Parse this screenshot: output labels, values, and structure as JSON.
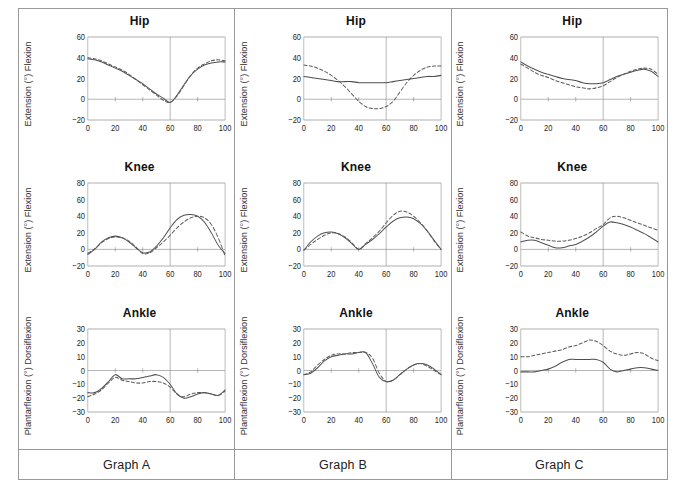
{
  "figure": {
    "columns": [
      {
        "id": "A",
        "footer_label": "Graph A",
        "charts": [
          {
            "title": "Hip",
            "ylabel": "Extension  (°)   Flexion",
            "yticks": [
              "60",
              "40",
              "20",
              "0",
              "−20"
            ],
            "xticks": [
              "0",
              "20",
              "40",
              "60",
              "80",
              "100"
            ]
          },
          {
            "title": "Knee",
            "ylabel": "Extension   (°)       Flexion",
            "yticks": [
              "80",
              "60",
              "40",
              "20",
              "0",
              "−20"
            ],
            "xticks": [
              "0",
              "20",
              "40",
              "60",
              "80",
              "100"
            ]
          },
          {
            "title": "Ankle",
            "ylabel": "Plantarflexion  (°)  Dorsiflexion",
            "yticks": [
              "30",
              "20",
              "10",
              "0",
              "−10",
              "−20",
              "−30"
            ],
            "xticks": [
              "0",
              "20",
              "40",
              "60",
              "80",
              "100"
            ]
          }
        ]
      },
      {
        "id": "B",
        "footer_label": "Graph B",
        "charts": [
          {
            "title": "Hip",
            "ylabel": "Extension  (°)   Flexion",
            "yticks": [
              "60",
              "40",
              "20",
              "0",
              "−20"
            ],
            "xticks": [
              "0",
              "20",
              "40",
              "60",
              "80",
              "100"
            ]
          },
          {
            "title": "Knee",
            "ylabel": "Extension   (°)       Flexion",
            "yticks": [
              "80",
              "60",
              "40",
              "20",
              "0",
              "−20"
            ],
            "xticks": [
              "0",
              "20",
              "40",
              "60",
              "80",
              "100"
            ]
          },
          {
            "title": "Ankle",
            "ylabel": "Plantarflexion  (°)  Dorsiflexion",
            "yticks": [
              "30",
              "20",
              "10",
              "0",
              "−10",
              "−20",
              "−30"
            ],
            "xticks": [
              "0",
              "20",
              "40",
              "60",
              "80",
              "100"
            ]
          }
        ]
      },
      {
        "id": "C",
        "footer_label": "Graph C",
        "charts": [
          {
            "title": "Hip",
            "ylabel": "Extension  (°)   Flexion",
            "yticks": [
              "60",
              "40",
              "20",
              "0",
              "−20"
            ],
            "xticks": [
              "0",
              "20",
              "40",
              "60",
              "80",
              "100"
            ]
          },
          {
            "title": "Knee",
            "ylabel": "Extension   (°)       Flexion",
            "yticks": [
              "80",
              "60",
              "40",
              "20",
              "0",
              "−20"
            ],
            "xticks": [
              "0",
              "20",
              "40",
              "60",
              "80",
              "100"
            ]
          },
          {
            "title": "Ankle",
            "ylabel": "Plantarflexion  (°)  Dorsiflexion",
            "yticks": [
              "30",
              "20",
              "10",
              "0",
              "−10",
              "−20",
              "−30"
            ],
            "xticks": [
              "0",
              "20",
              "40",
              "60",
              "80",
              "100"
            ]
          }
        ]
      }
    ],
    "colors": {
      "line_solid": "#4d4d4d",
      "line_dashed": "#5a5a5a",
      "axis": "#8c8c8c",
      "border": "#9a9a9a",
      "text": "#1a1a1a"
    }
  },
  "chart_data": [
    {
      "id": "A-hip",
      "type": "line",
      "title": "Hip",
      "panel": "Graph A",
      "xlabel": "",
      "ylabel": "Extension (°) Flexion",
      "xlim": [
        0,
        100
      ],
      "ylim": [
        -20,
        60
      ],
      "xticks": [
        0,
        20,
        40,
        60,
        80,
        100
      ],
      "yticks": [
        -20,
        0,
        20,
        40,
        60
      ],
      "grid": false,
      "zero_line": true,
      "toe_off_marker": 60,
      "x": [
        0,
        5,
        10,
        15,
        20,
        25,
        30,
        35,
        40,
        45,
        50,
        55,
        60,
        65,
        70,
        75,
        80,
        85,
        90,
        95,
        100
      ],
      "series": [
        {
          "name": "solid",
          "style": "solid",
          "values": [
            39,
            38,
            36,
            33,
            30,
            27,
            23,
            19,
            15,
            10,
            5,
            1,
            -3,
            4,
            14,
            23,
            29,
            33,
            35,
            36,
            36
          ]
        },
        {
          "name": "dashed",
          "style": "dashed",
          "values": [
            40,
            39,
            37,
            34,
            31,
            28,
            24,
            19,
            14,
            9,
            4,
            -1,
            -3,
            3,
            13,
            23,
            30,
            34,
            37,
            38,
            37
          ]
        }
      ]
    },
    {
      "id": "A-knee",
      "type": "line",
      "title": "Knee",
      "panel": "Graph A",
      "xlabel": "",
      "ylabel": "Extension (°) Flexion",
      "xlim": [
        0,
        100
      ],
      "ylim": [
        -20,
        80
      ],
      "xticks": [
        0,
        20,
        40,
        60,
        80,
        100
      ],
      "yticks": [
        -20,
        0,
        20,
        40,
        60,
        80
      ],
      "grid": false,
      "zero_line": true,
      "toe_off_marker": 60,
      "x": [
        0,
        5,
        10,
        15,
        20,
        25,
        30,
        35,
        40,
        45,
        50,
        55,
        60,
        65,
        70,
        75,
        80,
        85,
        90,
        95,
        100
      ],
      "series": [
        {
          "name": "solid",
          "style": "solid",
          "values": [
            -6,
            0,
            9,
            14,
            16,
            14,
            9,
            2,
            -4,
            -3,
            4,
            14,
            26,
            36,
            41,
            42,
            40,
            33,
            20,
            5,
            -5
          ]
        },
        {
          "name": "dashed",
          "style": "dashed",
          "values": [
            -5,
            1,
            8,
            13,
            15,
            14,
            10,
            3,
            -5,
            -4,
            2,
            9,
            17,
            26,
            33,
            38,
            40,
            38,
            30,
            14,
            -8
          ]
        }
      ]
    },
    {
      "id": "A-ankle",
      "type": "line",
      "title": "Ankle",
      "panel": "Graph A",
      "xlabel": "",
      "ylabel": "Plantarflexion (°) Dorsiflexion",
      "xlim": [
        0,
        100
      ],
      "ylim": [
        -30,
        30
      ],
      "xticks": [
        0,
        20,
        40,
        60,
        80,
        100
      ],
      "yticks": [
        -30,
        -20,
        -10,
        0,
        10,
        20,
        30
      ],
      "grid": false,
      "zero_line": true,
      "toe_off_marker": 60,
      "x": [
        0,
        5,
        10,
        15,
        20,
        25,
        30,
        35,
        40,
        45,
        50,
        55,
        60,
        65,
        70,
        75,
        80,
        85,
        90,
        95,
        100
      ],
      "series": [
        {
          "name": "solid",
          "style": "solid",
          "values": [
            -16,
            -16,
            -13,
            -8,
            -3,
            -6,
            -6,
            -6,
            -5,
            -4,
            -3,
            -5,
            -10,
            -17,
            -20,
            -19,
            -17,
            -16,
            -17,
            -18,
            -14
          ]
        },
        {
          "name": "dashed",
          "style": "dashed",
          "values": [
            -19,
            -17,
            -14,
            -9,
            -5,
            -7,
            -8,
            -9,
            -9,
            -8,
            -8,
            -9,
            -12,
            -17,
            -19,
            -17,
            -16,
            -16,
            -17,
            -18,
            -15
          ]
        }
      ]
    },
    {
      "id": "B-hip",
      "type": "line",
      "title": "Hip",
      "panel": "Graph B",
      "xlabel": "",
      "ylabel": "Extension (°) Flexion",
      "xlim": [
        0,
        100
      ],
      "ylim": [
        -20,
        60
      ],
      "xticks": [
        0,
        20,
        40,
        60,
        80,
        100
      ],
      "yticks": [
        -20,
        0,
        20,
        40,
        60
      ],
      "grid": false,
      "zero_line": true,
      "toe_off_marker": 60,
      "x": [
        0,
        5,
        10,
        15,
        20,
        25,
        30,
        35,
        40,
        45,
        50,
        55,
        60,
        65,
        70,
        75,
        80,
        85,
        90,
        95,
        100
      ],
      "series": [
        {
          "name": "solid",
          "style": "solid",
          "values": [
            22,
            21,
            20,
            19,
            18,
            17,
            17,
            17,
            16,
            16,
            16,
            16,
            16,
            17,
            18,
            19,
            20,
            21,
            22,
            22,
            23
          ]
        },
        {
          "name": "dashed",
          "style": "dashed",
          "values": [
            33,
            32,
            30,
            27,
            23,
            18,
            12,
            5,
            -2,
            -7,
            -9,
            -9,
            -7,
            -2,
            7,
            16,
            23,
            28,
            31,
            32,
            32
          ]
        }
      ]
    },
    {
      "id": "B-knee",
      "type": "line",
      "title": "Knee",
      "panel": "Graph B",
      "xlabel": "",
      "ylabel": "Extension (°) Flexion",
      "xlim": [
        0,
        100
      ],
      "ylim": [
        -20,
        80
      ],
      "xticks": [
        0,
        20,
        40,
        60,
        80,
        100
      ],
      "yticks": [
        -20,
        0,
        20,
        40,
        60,
        80
      ],
      "grid": false,
      "zero_line": true,
      "toe_off_marker": 60,
      "x": [
        0,
        5,
        10,
        15,
        20,
        25,
        30,
        35,
        40,
        45,
        50,
        55,
        60,
        65,
        70,
        75,
        80,
        85,
        90,
        95,
        100
      ],
      "series": [
        {
          "name": "solid",
          "style": "solid",
          "values": [
            -1,
            9,
            16,
            20,
            21,
            19,
            14,
            7,
            0,
            6,
            12,
            19,
            27,
            34,
            38,
            39,
            37,
            31,
            22,
            11,
            0
          ]
        },
        {
          "name": "dashed",
          "style": "dashed",
          "values": [
            -1,
            6,
            12,
            17,
            20,
            19,
            15,
            8,
            0,
            7,
            14,
            22,
            32,
            41,
            46,
            45,
            40,
            32,
            22,
            10,
            0
          ]
        }
      ]
    },
    {
      "id": "B-ankle",
      "type": "line",
      "title": "Ankle",
      "panel": "Graph B",
      "xlabel": "",
      "ylabel": "Plantarflexion (°) Dorsiflexion",
      "xlim": [
        0,
        100
      ],
      "ylim": [
        -30,
        30
      ],
      "xticks": [
        0,
        20,
        40,
        60,
        80,
        100
      ],
      "yticks": [
        -30,
        -20,
        -10,
        0,
        10,
        20,
        30
      ],
      "grid": false,
      "zero_line": true,
      "toe_off_marker": 60,
      "x": [
        0,
        5,
        10,
        15,
        20,
        25,
        30,
        35,
        40,
        45,
        50,
        55,
        60,
        65,
        70,
        75,
        80,
        85,
        90,
        95,
        100
      ],
      "series": [
        {
          "name": "solid",
          "style": "solid",
          "values": [
            -3,
            -2,
            2,
            7,
            10,
            11,
            12,
            12,
            13,
            13,
            5,
            -5,
            -8,
            -7,
            -3,
            1,
            4,
            5,
            4,
            1,
            -3
          ]
        },
        {
          "name": "dashed",
          "style": "dashed",
          "values": [
            -3,
            -1,
            4,
            8,
            11,
            12,
            12,
            13,
            13,
            13,
            9,
            -2,
            -8,
            -7,
            -3,
            1,
            4,
            5,
            3,
            0,
            -3
          ]
        }
      ]
    },
    {
      "id": "C-hip",
      "type": "line",
      "title": "Hip",
      "panel": "Graph C",
      "xlabel": "",
      "ylabel": "Extension (°) Flexion",
      "xlim": [
        0,
        100
      ],
      "ylim": [
        -20,
        60
      ],
      "xticks": [
        0,
        20,
        40,
        60,
        80,
        100
      ],
      "yticks": [
        -20,
        0,
        20,
        40,
        60
      ],
      "grid": false,
      "zero_line": true,
      "toe_off_marker": 60,
      "x": [
        0,
        5,
        10,
        15,
        20,
        25,
        30,
        35,
        40,
        45,
        50,
        55,
        60,
        65,
        70,
        75,
        80,
        85,
        90,
        95,
        100
      ],
      "series": [
        {
          "name": "solid",
          "style": "solid",
          "values": [
            36,
            32,
            29,
            26,
            24,
            22,
            20,
            19,
            18,
            16,
            15,
            15,
            16,
            19,
            22,
            24,
            26,
            28,
            29,
            27,
            22
          ]
        },
        {
          "name": "dashed",
          "style": "dashed",
          "values": [
            34,
            30,
            26,
            23,
            21,
            18,
            16,
            14,
            12,
            11,
            10,
            11,
            13,
            17,
            21,
            24,
            27,
            29,
            30,
            29,
            24
          ]
        }
      ]
    },
    {
      "id": "C-knee",
      "type": "line",
      "title": "Knee",
      "panel": "Graph C",
      "xlabel": "",
      "ylabel": "Extension (°) Flexion",
      "xlim": [
        0,
        100
      ],
      "ylim": [
        -20,
        80
      ],
      "xticks": [
        0,
        20,
        40,
        60,
        80,
        100
      ],
      "yticks": [
        -20,
        0,
        20,
        40,
        60,
        80
      ],
      "grid": false,
      "zero_line": true,
      "toe_off_marker": 60,
      "x": [
        0,
        5,
        10,
        15,
        20,
        25,
        30,
        35,
        40,
        45,
        50,
        55,
        60,
        65,
        70,
        75,
        80,
        85,
        90,
        95,
        100
      ],
      "series": [
        {
          "name": "solid",
          "style": "solid",
          "values": [
            9,
            11,
            11,
            8,
            5,
            2,
            2,
            4,
            6,
            10,
            15,
            21,
            28,
            33,
            32,
            30,
            27,
            23,
            19,
            14,
            9
          ]
        },
        {
          "name": "dashed",
          "style": "dashed",
          "values": [
            21,
            16,
            14,
            12,
            11,
            10,
            10,
            11,
            13,
            16,
            20,
            25,
            30,
            38,
            40,
            38,
            35,
            32,
            29,
            26,
            23
          ]
        }
      ]
    },
    {
      "id": "C-ankle",
      "type": "line",
      "title": "Ankle",
      "panel": "Graph C",
      "xlabel": "",
      "ylabel": "Plantarflexion (°) Dorsiflexion",
      "xlim": [
        0,
        100
      ],
      "ylim": [
        -30,
        30
      ],
      "xticks": [
        0,
        20,
        40,
        60,
        80,
        100
      ],
      "yticks": [
        -30,
        -20,
        -10,
        0,
        10,
        20,
        30
      ],
      "grid": false,
      "zero_line": true,
      "toe_off_marker": 60,
      "x": [
        0,
        5,
        10,
        15,
        20,
        25,
        30,
        35,
        40,
        45,
        50,
        55,
        60,
        65,
        70,
        75,
        80,
        85,
        90,
        95,
        100
      ],
      "series": [
        {
          "name": "solid",
          "style": "solid",
          "values": [
            -1,
            -1,
            -1,
            0,
            1,
            3,
            6,
            8,
            8,
            8,
            8,
            8,
            6,
            1,
            -1,
            0,
            1,
            2,
            2,
            1,
            0
          ]
        },
        {
          "name": "dashed",
          "style": "dashed",
          "values": [
            10,
            10,
            11,
            12,
            13,
            14,
            15,
            17,
            18,
            20,
            22,
            21,
            18,
            14,
            12,
            11,
            12,
            13,
            12,
            9,
            7
          ]
        }
      ]
    }
  ]
}
